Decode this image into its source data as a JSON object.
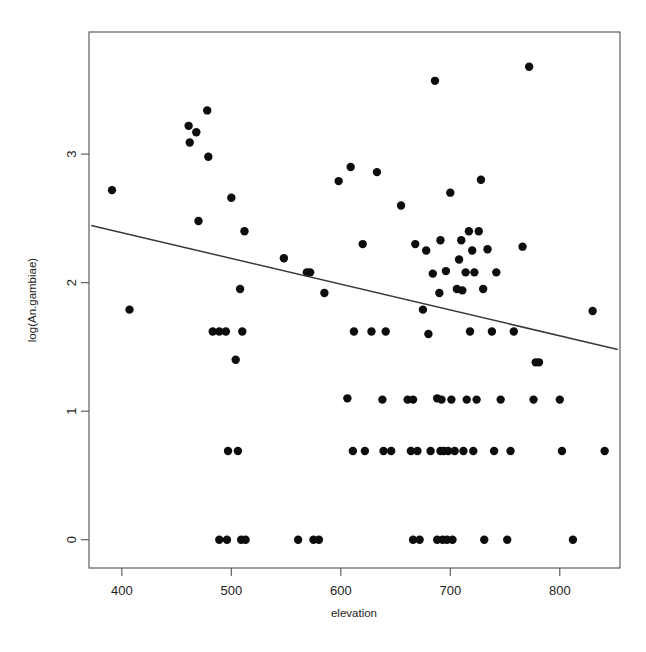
{
  "chart_data": {
    "type": "scatter",
    "title": "",
    "xlabel": "elevation",
    "ylabel": "log(An.gambiae)",
    "xlim": [
      370,
      855
    ],
    "ylim": [
      -0.22,
      3.95
    ],
    "xticks": [
      400,
      500,
      600,
      700,
      800
    ],
    "yticks": [
      0,
      1,
      2,
      3
    ],
    "xtick_labels": [
      "400",
      "500",
      "600",
      "700",
      "800"
    ],
    "ytick_labels": [
      "0",
      "1",
      "2",
      "3"
    ],
    "grid": false,
    "legend": null,
    "marker": "filled-circle",
    "marker_color": "#0d0d0d",
    "marker_size_px": 4.2,
    "frame": "box",
    "fit_line": {
      "type": "linear-regression",
      "color": "#3a3a3a",
      "x_start": 372,
      "y_start": 2.445,
      "x_end": 853,
      "y_end": 1.48
    },
    "points": [
      {
        "x": 391,
        "y": 2.72
      },
      {
        "x": 407,
        "y": 1.79
      },
      {
        "x": 461,
        "y": 3.22
      },
      {
        "x": 462,
        "y": 3.09
      },
      {
        "x": 468,
        "y": 3.17
      },
      {
        "x": 470,
        "y": 2.48
      },
      {
        "x": 478,
        "y": 3.34
      },
      {
        "x": 479,
        "y": 2.98
      },
      {
        "x": 483,
        "y": 1.62
      },
      {
        "x": 489,
        "y": 1.62
      },
      {
        "x": 489,
        "y": 0.0
      },
      {
        "x": 495,
        "y": 1.62
      },
      {
        "x": 496,
        "y": 0.0
      },
      {
        "x": 497,
        "y": 0.69
      },
      {
        "x": 500,
        "y": 2.66
      },
      {
        "x": 504,
        "y": 1.4
      },
      {
        "x": 506,
        "y": 0.69
      },
      {
        "x": 508,
        "y": 1.95
      },
      {
        "x": 509,
        "y": 0.0
      },
      {
        "x": 510,
        "y": 1.62
      },
      {
        "x": 512,
        "y": 2.4
      },
      {
        "x": 513,
        "y": 0.0
      },
      {
        "x": 548,
        "y": 2.19
      },
      {
        "x": 561,
        "y": 0.0
      },
      {
        "x": 569,
        "y": 2.08
      },
      {
        "x": 572,
        "y": 2.08
      },
      {
        "x": 575,
        "y": 0.0
      },
      {
        "x": 580,
        "y": 0.0
      },
      {
        "x": 585,
        "y": 1.92
      },
      {
        "x": 598,
        "y": 2.79
      },
      {
        "x": 606,
        "y": 1.1
      },
      {
        "x": 609,
        "y": 2.9
      },
      {
        "x": 611,
        "y": 0.69
      },
      {
        "x": 612,
        "y": 1.62
      },
      {
        "x": 620,
        "y": 2.3
      },
      {
        "x": 622,
        "y": 0.69
      },
      {
        "x": 628,
        "y": 1.62
      },
      {
        "x": 633,
        "y": 2.86
      },
      {
        "x": 638,
        "y": 1.09
      },
      {
        "x": 639,
        "y": 0.69
      },
      {
        "x": 641,
        "y": 1.62
      },
      {
        "x": 646,
        "y": 0.69
      },
      {
        "x": 655,
        "y": 2.6
      },
      {
        "x": 661,
        "y": 1.09
      },
      {
        "x": 664,
        "y": 0.69
      },
      {
        "x": 666,
        "y": 1.09
      },
      {
        "x": 666,
        "y": 0.0
      },
      {
        "x": 668,
        "y": 2.3
      },
      {
        "x": 670,
        "y": 0.69
      },
      {
        "x": 672,
        "y": 0.0
      },
      {
        "x": 675,
        "y": 1.79
      },
      {
        "x": 678,
        "y": 2.25
      },
      {
        "x": 680,
        "y": 1.6
      },
      {
        "x": 682,
        "y": 0.69
      },
      {
        "x": 684,
        "y": 2.07
      },
      {
        "x": 686,
        "y": 3.57
      },
      {
        "x": 688,
        "y": 1.1
      },
      {
        "x": 688,
        "y": 0.0
      },
      {
        "x": 690,
        "y": 1.92
      },
      {
        "x": 691,
        "y": 2.33
      },
      {
        "x": 691,
        "y": 0.69
      },
      {
        "x": 692,
        "y": 1.09
      },
      {
        "x": 693,
        "y": 0.0
      },
      {
        "x": 694,
        "y": 0.69
      },
      {
        "x": 696,
        "y": 2.09
      },
      {
        "x": 697,
        "y": 0.0
      },
      {
        "x": 698,
        "y": 0.69
      },
      {
        "x": 700,
        "y": 2.7
      },
      {
        "x": 701,
        "y": 1.09
      },
      {
        "x": 702,
        "y": 0.0
      },
      {
        "x": 704,
        "y": 0.69
      },
      {
        "x": 706,
        "y": 1.95
      },
      {
        "x": 708,
        "y": 2.18
      },
      {
        "x": 710,
        "y": 2.33
      },
      {
        "x": 711,
        "y": 1.94
      },
      {
        "x": 712,
        "y": 0.69
      },
      {
        "x": 714,
        "y": 2.08
      },
      {
        "x": 715,
        "y": 1.09
      },
      {
        "x": 717,
        "y": 2.4
      },
      {
        "x": 718,
        "y": 1.62
      },
      {
        "x": 720,
        "y": 2.25
      },
      {
        "x": 721,
        "y": 0.69
      },
      {
        "x": 722,
        "y": 2.08
      },
      {
        "x": 724,
        "y": 1.09
      },
      {
        "x": 726,
        "y": 2.4
      },
      {
        "x": 728,
        "y": 2.8
      },
      {
        "x": 730,
        "y": 1.95
      },
      {
        "x": 731,
        "y": 0.0
      },
      {
        "x": 734,
        "y": 2.26
      },
      {
        "x": 738,
        "y": 1.62
      },
      {
        "x": 740,
        "y": 0.69
      },
      {
        "x": 742,
        "y": 2.08
      },
      {
        "x": 746,
        "y": 1.09
      },
      {
        "x": 752,
        "y": 0.0
      },
      {
        "x": 755,
        "y": 0.69
      },
      {
        "x": 758,
        "y": 1.62
      },
      {
        "x": 766,
        "y": 2.28
      },
      {
        "x": 772,
        "y": 3.68
      },
      {
        "x": 776,
        "y": 1.09
      },
      {
        "x": 778,
        "y": 1.38
      },
      {
        "x": 781,
        "y": 1.38
      },
      {
        "x": 800,
        "y": 1.09
      },
      {
        "x": 802,
        "y": 0.69
      },
      {
        "x": 812,
        "y": 0.0
      },
      {
        "x": 830,
        "y": 1.78
      },
      {
        "x": 841,
        "y": 0.69
      }
    ]
  }
}
